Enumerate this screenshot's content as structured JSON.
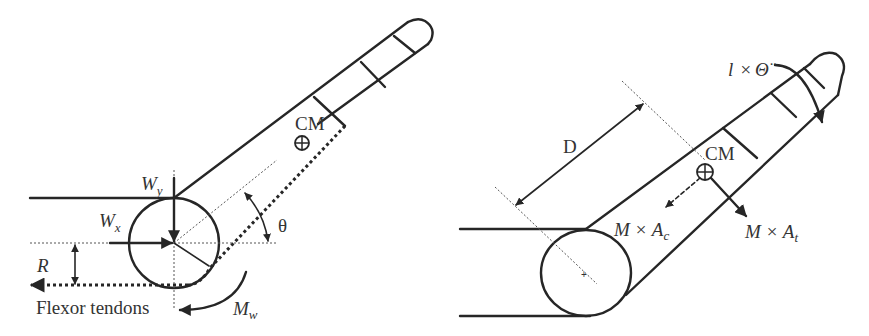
{
  "left_figure": {
    "labels": {
      "wy_main": "W",
      "wy_sub": "y",
      "wx_main": "W",
      "wx_sub": "x",
      "cm": "CM",
      "theta": "θ",
      "r": "R",
      "mw_main": "M",
      "mw_sub": "w",
      "flexor": "Flexor tendons"
    }
  },
  "right_figure": {
    "labels": {
      "inertia_l": "l",
      "inertia_times": "×",
      "inertia_theta": "Θ̈",
      "d": "D",
      "cm": "CM",
      "mac_main": "M × A",
      "mac_sub": "c",
      "mat_main": "M × A",
      "mat_sub": "t"
    }
  },
  "colors": {
    "line": "#262626",
    "text": "#333333",
    "background": "#ffffff"
  }
}
